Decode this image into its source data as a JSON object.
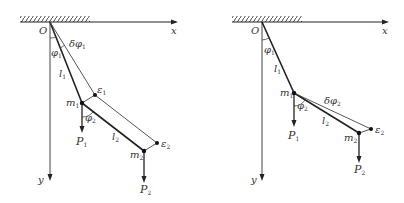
{
  "figure": {
    "colors": {
      "ink": "#222222",
      "thin": "#444444"
    },
    "left_panel": {
      "name": "virtual displacement of first angle",
      "labels": {
        "origin": "O",
        "x_axis": "x",
        "y_axis": "y",
        "phi1": "φ",
        "phi1_sub": "1",
        "delta_phi": "δφ",
        "delta_phi_sub": "1",
        "l1": "l",
        "l1_sub": "1",
        "eps1": "ε",
        "eps1_sub": "1",
        "m1": "m",
        "m1_sub": "1",
        "phi2": "φ",
        "phi2_sub": "2",
        "l2": "l",
        "l2_sub": "2",
        "eps2": "ε",
        "eps2_sub": "2",
        "m2": "m",
        "m2_sub": "2",
        "P1": "P",
        "P1_sub": "1",
        "P2": "P",
        "P2_sub": "2"
      }
    },
    "right_panel": {
      "name": "virtual displacement of second angle",
      "labels": {
        "origin": "O",
        "x_axis": "x",
        "y_axis": "y",
        "phi1": "φ",
        "phi1_sub": "1",
        "l1": "l",
        "l1_sub": "1",
        "m1": "m",
        "m1_sub": "1",
        "phi2": "φ",
        "phi2_sub": "2",
        "delta_phi": "δφ",
        "delta_phi_sub": "2",
        "l2": "l",
        "l2_sub": "2",
        "eps2": "ε",
        "eps2_sub": "2",
        "m2": "m",
        "m2_sub": "2",
        "P1": "P",
        "P1_sub": "1",
        "P2": "P",
        "P2_sub": "2"
      }
    }
  }
}
